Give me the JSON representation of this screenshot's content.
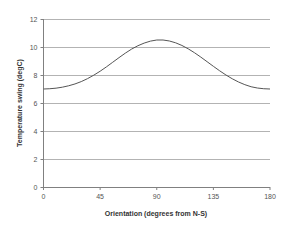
{
  "chart_data": {
    "type": "line",
    "title": "",
    "xlabel": "Orientation (degrees from N-S)",
    "ylabel": "Temperature swing (degC)",
    "xlim": [
      0,
      180
    ],
    "ylim": [
      0,
      12
    ],
    "xticks": [
      0,
      45,
      90,
      135,
      180
    ],
    "yticks": [
      0,
      2,
      4,
      6,
      8,
      10,
      12
    ],
    "xtick_labels": [
      "0",
      "45",
      "90",
      "135",
      "180"
    ],
    "ytick_labels": [
      "0",
      "2",
      "4",
      "6",
      "8",
      "10",
      "12"
    ],
    "grid": {
      "horizontal": true,
      "vertical": false
    },
    "legend": null,
    "series": [
      {
        "name": "Temperature swing",
        "color": "#555555",
        "x": [
          0,
          5,
          10,
          15,
          20,
          25,
          30,
          35,
          40,
          45,
          50,
          55,
          60,
          65,
          70,
          75,
          80,
          85,
          90,
          95,
          100,
          105,
          110,
          115,
          120,
          125,
          130,
          135,
          140,
          145,
          150,
          155,
          160,
          165,
          170,
          175,
          180
        ],
        "y": [
          7.0,
          7.02,
          7.06,
          7.13,
          7.23,
          7.36,
          7.53,
          7.74,
          7.99,
          8.27,
          8.58,
          8.91,
          9.24,
          9.56,
          9.85,
          10.09,
          10.28,
          10.42,
          10.5,
          10.5,
          10.43,
          10.3,
          10.11,
          9.87,
          9.59,
          9.28,
          8.95,
          8.62,
          8.3,
          8.0,
          7.73,
          7.5,
          7.31,
          7.16,
          7.07,
          7.02,
          7.0
        ]
      }
    ]
  },
  "axis_style": {
    "grid_color": "#b3b3b3",
    "axis_color": "#808080",
    "line_color": "#555555",
    "background": "#ffffff"
  }
}
